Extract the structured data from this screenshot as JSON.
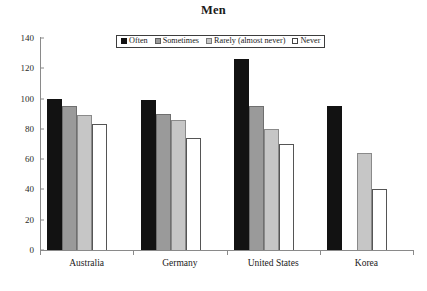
{
  "chart_data": {
    "type": "bar",
    "title": "Men",
    "xlabel": "",
    "ylabel": "",
    "ylim": [
      0,
      140
    ],
    "ytick_step": 20,
    "yticks": [
      0,
      20,
      40,
      60,
      80,
      100,
      120,
      140
    ],
    "grid": false,
    "legend_position": "top-center",
    "categories": [
      "Australia",
      "Germany",
      "United States",
      "Korea"
    ],
    "series": [
      {
        "name": "Often",
        "color": "#121212",
        "values": [
          100,
          99,
          126,
          95
        ]
      },
      {
        "name": "Sometimes",
        "color": "#9a9a9a",
        "values": [
          95,
          90,
          95,
          null
        ]
      },
      {
        "name": "Rarely (almost never)",
        "color": "#c6c6c6",
        "values": [
          89,
          86,
          80,
          64
        ]
      },
      {
        "name": "Never",
        "color": "#ffffff",
        "values": [
          83,
          74,
          70,
          40
        ]
      }
    ]
  },
  "legend": {
    "items": [
      {
        "label": "Often"
      },
      {
        "label": "Sometimes"
      },
      {
        "label": "Rarely (almost never)"
      },
      {
        "label": "Never"
      }
    ]
  }
}
